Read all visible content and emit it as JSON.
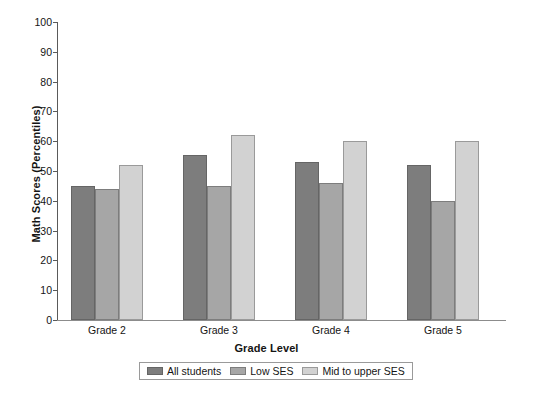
{
  "chart_data": {
    "type": "bar",
    "title": "",
    "xlabel": "Grade Level",
    "ylabel": "Math Scores (Percentiles)",
    "categories": [
      "Grade 2",
      "Grade 3",
      "Grade 4",
      "Grade 5"
    ],
    "series": [
      {
        "name": "All students",
        "color": "#7d7d7d",
        "values": [
          45,
          55.5,
          53,
          52
        ]
      },
      {
        "name": "Low SES",
        "color": "#a6a6a6",
        "values": [
          44,
          45,
          46,
          40
        ]
      },
      {
        "name": "Mid to upper SES",
        "color": "#d2d2d2",
        "values": [
          52,
          62,
          60,
          60
        ]
      }
    ],
    "ylim": [
      0,
      100
    ],
    "ytick_labels": [
      "100",
      "90",
      "80",
      "70",
      "60",
      "50",
      "40",
      "30",
      "20",
      "10",
      "0"
    ],
    "ytick_values": [
      100,
      90,
      80,
      70,
      60,
      50,
      40,
      30,
      20,
      10,
      0
    ],
    "grid": false,
    "legend_position": "bottom-center"
  },
  "legend": {
    "items": [
      {
        "label": "All students"
      },
      {
        "label": "Low SES"
      },
      {
        "label": "Mid to upper SES"
      }
    ]
  },
  "top_fragment": {
    "a": "",
    "b": "",
    "c": ""
  }
}
